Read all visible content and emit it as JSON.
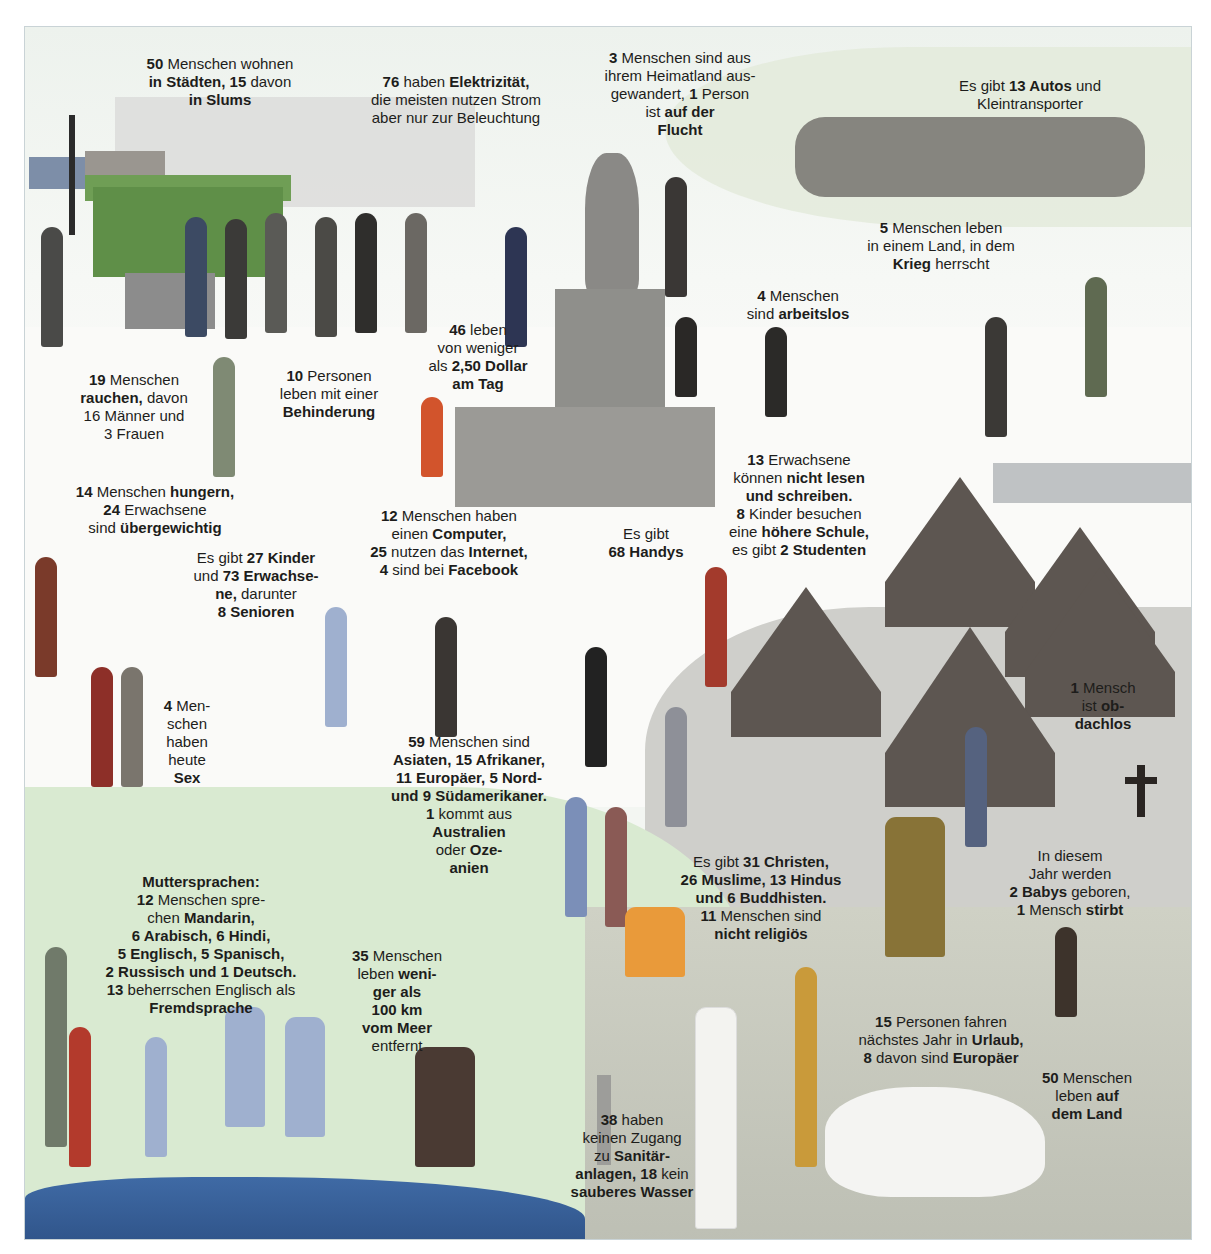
{
  "infographic": {
    "palette": {
      "text": "#1d1d1b",
      "sky": "#eef3ee",
      "grass": "#d9ead1",
      "water": "#3f6aa5",
      "village": "#5d5651",
      "kiosk": "#5f8f48"
    },
    "labels": [
      {
        "id": "cities",
        "text_parts": [
          [
            "50",
            true
          ],
          [
            " Menschen wohnen\n",
            false
          ],
          [
            "in Städten, 15",
            true
          ],
          [
            " davon\n",
            false
          ],
          [
            "in Slums",
            true
          ]
        ]
      },
      {
        "id": "electricity",
        "text_parts": [
          [
            "76",
            true
          ],
          [
            " haben ",
            false
          ],
          [
            "Elektrizität,",
            true
          ],
          [
            "\ndie meisten nutzen Strom\naber nur zur Beleuchtung",
            false
          ]
        ]
      },
      {
        "id": "emigrated",
        "text_parts": [
          [
            "3",
            true
          ],
          [
            " Menschen sind aus\nihrem Heimatland aus-\ngewandert, ",
            false
          ],
          [
            "1",
            true
          ],
          [
            " Person\nist ",
            false
          ],
          [
            "auf der\nFlucht",
            true
          ]
        ]
      },
      {
        "id": "cars",
        "text_parts": [
          [
            "Es gibt ",
            false
          ],
          [
            "13 Autos",
            true
          ],
          [
            " und\nKleintransporter",
            false
          ]
        ]
      },
      {
        "id": "war",
        "text_parts": [
          [
            "5",
            true
          ],
          [
            " Menschen leben\nin einem Land, in dem\n",
            false
          ],
          [
            "Krieg",
            true
          ],
          [
            " herrscht",
            false
          ]
        ]
      },
      {
        "id": "unemployed",
        "text_parts": [
          [
            "4",
            true
          ],
          [
            " Menschen\nsind ",
            false
          ],
          [
            "arbeitslos",
            true
          ]
        ]
      },
      {
        "id": "poverty",
        "text_parts": [
          [
            "46",
            true
          ],
          [
            " leben\nvon weniger\nals ",
            false
          ],
          [
            "2,50 Dollar\nam Tag",
            true
          ]
        ]
      },
      {
        "id": "smoking",
        "text_parts": [
          [
            "19",
            true
          ],
          [
            " Menschen\n",
            false
          ],
          [
            "rauchen,",
            true
          ],
          [
            " davon\n16 Männer und\n3 Frauen",
            false
          ]
        ]
      },
      {
        "id": "disability",
        "text_parts": [
          [
            "10",
            true
          ],
          [
            " Personen\nleben mit einer\n",
            false
          ],
          [
            "Behinderung",
            true
          ]
        ]
      },
      {
        "id": "hunger",
        "text_parts": [
          [
            "14",
            true
          ],
          [
            " Menschen ",
            false
          ],
          [
            "hungern,",
            true
          ],
          [
            "\n",
            false
          ],
          [
            "24",
            true
          ],
          [
            " Erwachsene\nsind ",
            false
          ],
          [
            "übergewichtig",
            true
          ]
        ]
      },
      {
        "id": "computer",
        "text_parts": [
          [
            "12",
            true
          ],
          [
            " Menschen haben\neinen ",
            false
          ],
          [
            "Computer,",
            true
          ],
          [
            "\n",
            false
          ],
          [
            "25",
            true
          ],
          [
            " nutzen das ",
            false
          ],
          [
            "Internet,",
            true
          ],
          [
            "\n",
            false
          ],
          [
            "4",
            true
          ],
          [
            " sind bei ",
            false
          ],
          [
            "Facebook",
            true
          ]
        ]
      },
      {
        "id": "literacy",
        "text_parts": [
          [
            "13",
            true
          ],
          [
            " Erwachsene\nkönnen ",
            false
          ],
          [
            "nicht lesen\nund schreiben.",
            true
          ],
          [
            "\n",
            false
          ],
          [
            "8",
            true
          ],
          [
            " Kinder besuchen\neine ",
            false
          ],
          [
            "höhere Schule,",
            true
          ],
          [
            "\nes gibt ",
            false
          ],
          [
            "2 Studenten",
            true
          ]
        ]
      },
      {
        "id": "phones",
        "text_parts": [
          [
            "Es gibt\n",
            false
          ],
          [
            "68 Handys",
            true
          ]
        ]
      },
      {
        "id": "children",
        "text_parts": [
          [
            "Es gibt ",
            false
          ],
          [
            "27 Kinder",
            true
          ],
          [
            "\nund ",
            false
          ],
          [
            "73 Erwachse-\nne,",
            true
          ],
          [
            " darunter\n",
            false
          ],
          [
            "8 Senioren",
            true
          ]
        ]
      },
      {
        "id": "sex",
        "text_parts": [
          [
            "4",
            true
          ],
          [
            " Men-\nschen\nhaben\nheute\n",
            false
          ],
          [
            "Sex",
            true
          ]
        ]
      },
      {
        "id": "origin",
        "text_parts": [
          [
            "59",
            true
          ],
          [
            " Menschen sind\n",
            false
          ],
          [
            "Asiaten, 15 Afrikaner,\n11 Europäer, 5 Nord-\nund 9 Südamerikaner.",
            true
          ],
          [
            "\n",
            false
          ],
          [
            "1",
            true
          ],
          [
            " kommt aus\n",
            false
          ],
          [
            "Australien",
            true
          ],
          [
            "\noder ",
            false
          ],
          [
            "Oze-\nanien",
            true
          ]
        ]
      },
      {
        "id": "homeless",
        "text_parts": [
          [
            "1",
            true
          ],
          [
            " Mensch\nist ",
            false
          ],
          [
            "ob-\ndachlos",
            true
          ]
        ]
      },
      {
        "id": "religion",
        "text_parts": [
          [
            "Es gibt ",
            false
          ],
          [
            "31 Christen,\n26 Muslime, 13 Hindus\nund 6 Buddhisten.",
            true
          ],
          [
            "\n",
            false
          ],
          [
            "11",
            true
          ],
          [
            " Menschen sind\n",
            false
          ],
          [
            "nicht religiös",
            true
          ]
        ]
      },
      {
        "id": "births",
        "text_parts": [
          [
            "In diesem\nJahr werden\n",
            false
          ],
          [
            "2 Babys",
            true
          ],
          [
            " geboren,\n",
            false
          ],
          [
            "1",
            true
          ],
          [
            " Mensch ",
            false
          ],
          [
            "stirbt",
            true
          ]
        ]
      },
      {
        "id": "languages",
        "text_parts": [
          [
            "Muttersprachen:",
            true
          ],
          [
            "\n",
            false
          ],
          [
            "12",
            true
          ],
          [
            " Menschen spre-\nchen ",
            false
          ],
          [
            "Mandarin,\n6 Arabisch, 6 Hindi,\n5 Englisch, 5 Spanisch,\n2 Russisch und 1 Deutsch.",
            true
          ],
          [
            "\n",
            false
          ],
          [
            "13",
            true
          ],
          [
            " beherrschen Englisch als\n",
            false
          ],
          [
            "Fremdsprache",
            true
          ]
        ]
      },
      {
        "id": "sea",
        "text_parts": [
          [
            "35",
            true
          ],
          [
            " Menschen\nleben ",
            false
          ],
          [
            "weni-\nger als\n100 km\nvom Meer",
            true
          ],
          [
            "\nentfernt",
            false
          ]
        ]
      },
      {
        "id": "vacation",
        "text_parts": [
          [
            "15",
            true
          ],
          [
            " Personen fahren\nnächstes Jahr in ",
            false
          ],
          [
            "Urlaub,",
            true
          ],
          [
            "\n",
            false
          ],
          [
            "8",
            true
          ],
          [
            " davon sind ",
            false
          ],
          [
            "Europäer",
            true
          ]
        ]
      },
      {
        "id": "rural",
        "text_parts": [
          [
            "50",
            true
          ],
          [
            " Menschen\nleben ",
            false
          ],
          [
            "auf\ndem Land",
            true
          ]
        ]
      },
      {
        "id": "sanitation",
        "text_parts": [
          [
            "38",
            true
          ],
          [
            " haben\nkeinen Zugang\nzu ",
            false
          ],
          [
            "Sanitär-\nanlagen, 18",
            true
          ],
          [
            " kein\n",
            false
          ],
          [
            "sauberes Wasser",
            true
          ]
        ]
      }
    ]
  }
}
